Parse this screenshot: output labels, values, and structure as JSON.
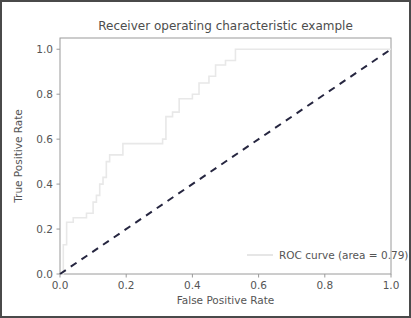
{
  "chart_data": {
    "type": "line",
    "title": "Receiver operating characteristic example",
    "xlabel": "False Positive Rate",
    "ylabel": "True Positive Rate",
    "xlim": [
      0.0,
      1.0
    ],
    "ylim": [
      0.0,
      1.05
    ],
    "grid": false,
    "legend_position": "lower right",
    "xticks": [
      "0.0",
      "0.2",
      "0.4",
      "0.6",
      "0.8",
      "1.0"
    ],
    "xtick_values": [
      0.0,
      0.2,
      0.4,
      0.6,
      0.8,
      1.0
    ],
    "yticks": [
      "0.0",
      "0.2",
      "0.4",
      "0.6",
      "0.8",
      "1.0"
    ],
    "ytick_values": [
      0.0,
      0.2,
      0.4,
      0.6,
      0.8,
      1.0
    ],
    "series": [
      {
        "name": "ROC curve (area = 0.79)",
        "style": "step-post",
        "color": "#e8e8e8",
        "linewidth": 1.6,
        "x": [
          0.0,
          0.01,
          0.01,
          0.02,
          0.02,
          0.04,
          0.04,
          0.08,
          0.08,
          0.1,
          0.1,
          0.11,
          0.11,
          0.12,
          0.12,
          0.13,
          0.13,
          0.14,
          0.14,
          0.15,
          0.15,
          0.19,
          0.19,
          0.31,
          0.31,
          0.32,
          0.32,
          0.34,
          0.34,
          0.36,
          0.36,
          0.4,
          0.4,
          0.42,
          0.42,
          0.45,
          0.45,
          0.47,
          0.47,
          0.5,
          0.5,
          0.53,
          0.53,
          0.58,
          0.58,
          1.0
        ],
        "y": [
          0.0,
          0.0,
          0.13,
          0.13,
          0.23,
          0.23,
          0.25,
          0.25,
          0.27,
          0.27,
          0.32,
          0.32,
          0.35,
          0.35,
          0.4,
          0.4,
          0.43,
          0.43,
          0.5,
          0.5,
          0.53,
          0.53,
          0.58,
          0.58,
          0.6,
          0.6,
          0.7,
          0.7,
          0.72,
          0.72,
          0.78,
          0.78,
          0.8,
          0.8,
          0.85,
          0.85,
          0.88,
          0.88,
          0.93,
          0.93,
          0.95,
          0.95,
          1.0,
          1.0,
          1.0,
          1.0
        ]
      },
      {
        "name": "chance-diagonal",
        "style": "dashed",
        "color": "#262640",
        "linewidth": 2,
        "x": [
          0.0,
          1.0
        ],
        "y": [
          0.0,
          1.0
        ]
      }
    ],
    "legend_entries": [
      {
        "label": "ROC curve (area = 0.79)",
        "color": "#e0e0e0"
      }
    ],
    "annotations": {
      "area_under_curve": 0.79
    }
  },
  "figure": {
    "border_color": "#4a4a4a",
    "background": "#ffffff"
  }
}
